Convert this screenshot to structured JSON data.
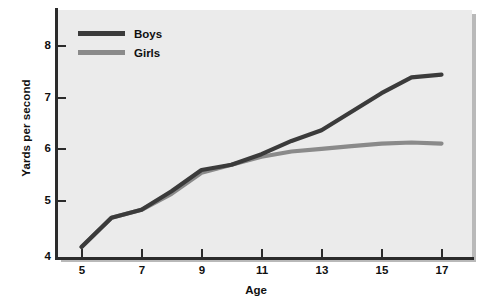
{
  "chart_data": {
    "type": "line",
    "title": "",
    "xlabel": "Age",
    "ylabel": "Yards per second",
    "xlim": [
      5,
      17
    ],
    "ylim": [
      4,
      8.4
    ],
    "grid": false,
    "legend_position": "top-left",
    "x": [
      5,
      6,
      7,
      8,
      9,
      10,
      11,
      12,
      13,
      14,
      15,
      16,
      17
    ],
    "xticks": [
      5,
      7,
      9,
      11,
      13,
      15,
      17
    ],
    "yticks": [
      4,
      5,
      6,
      7,
      8
    ],
    "series": [
      {
        "name": "Boys",
        "color": "#3b3b3b",
        "values": [
          4.2,
          4.75,
          4.9,
          5.25,
          5.65,
          5.75,
          5.95,
          6.2,
          6.4,
          6.75,
          7.1,
          7.4,
          7.45
        ]
      },
      {
        "name": "Girls",
        "color": "#8a8a8a",
        "values": [
          4.2,
          4.75,
          4.9,
          5.2,
          5.6,
          5.75,
          5.9,
          6.0,
          6.05,
          6.1,
          6.15,
          6.17,
          6.15
        ]
      }
    ]
  },
  "legend": {
    "items": [
      {
        "label": "Boys",
        "swatch": "boys"
      },
      {
        "label": "Girls",
        "swatch": "girls"
      }
    ]
  },
  "axes": {
    "y_title": "Yards per second",
    "x_title": "Age",
    "y_tick_labels": [
      "8",
      "7",
      "6",
      "5",
      "4"
    ],
    "x_tick_labels": [
      "5",
      "7",
      "9",
      "11",
      "13",
      "15",
      "17"
    ]
  }
}
